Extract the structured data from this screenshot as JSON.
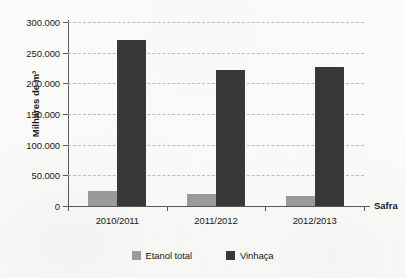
{
  "chart_data": {
    "type": "bar",
    "title": "",
    "subtitle": "",
    "categories": [
      "2010/2011",
      "2011/2012",
      "2012/2013"
    ],
    "series": [
      {
        "name": "Etanol total",
        "color": "#9a9a9a",
        "values": [
          25000,
          19000,
          17000
        ]
      },
      {
        "name": "Vinhaça",
        "color": "#383838",
        "values": [
          270000,
          222000,
          226000
        ]
      }
    ],
    "xlabel": "Safra",
    "ylabel": "Milhares de m³",
    "ylim": [
      0,
      300000
    ],
    "ytick_step": 50000,
    "ytick_labels": [
      "300.000",
      "250.000",
      "200.000",
      "150.000",
      "100.000",
      "50.000",
      "0"
    ],
    "ytick_values": [
      300000,
      250000,
      200000,
      150000,
      100000,
      50000,
      0
    ],
    "grid": true,
    "grid_style": "dashed",
    "grid_color": "#bcbcbc",
    "legend_position": "bottom-center",
    "axis_color": "#55585c",
    "background": "#fbfbf9"
  }
}
